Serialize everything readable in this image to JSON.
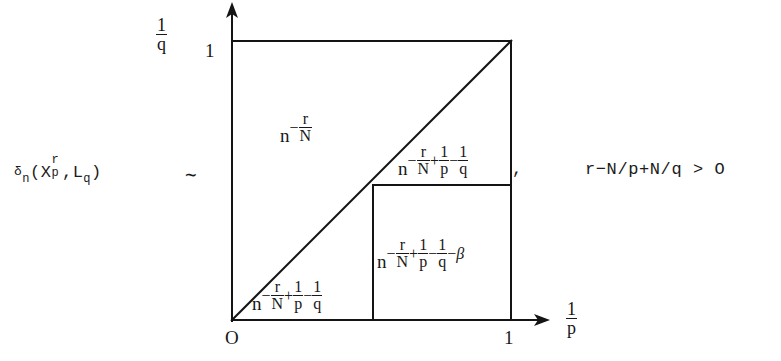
{
  "figure": {
    "lhs": {
      "delta": "δ",
      "delta_sub": "n",
      "open_paren": "(X",
      "x_sup": "r",
      "x_sub": "p",
      "comma_L": ",L",
      "l_sub": "q",
      "close_paren": ")",
      "relation": "∼"
    },
    "separator_comma": ",",
    "condition": "r−N/p+N/q > O",
    "axes": {
      "y_label_num": "1",
      "y_label_den": "q",
      "x_label_num": "1",
      "x_label_den": "p",
      "y_tick_top": "1",
      "origin_tick": "O",
      "x_tick_right": "1"
    },
    "regions": [
      {
        "name": "upper-left",
        "base": "n",
        "exponent_parts": [
          "-",
          "r/N"
        ],
        "text": "n^(-r/N)"
      },
      {
        "name": "middle-right",
        "base": "n",
        "exponent_parts": [
          "-",
          "r/N",
          "+",
          "1/p",
          "-",
          "1/q"
        ],
        "text": "n^(-r/N+1/p-1/q)"
      },
      {
        "name": "lower-right",
        "base": "n",
        "exponent_parts": [
          "-",
          "r/N",
          "+",
          "1/p",
          "-",
          "1/q",
          "-",
          "β"
        ],
        "text": "n^(-r/N+1/p-1/q-β)"
      },
      {
        "name": "bottom-left",
        "base": "n",
        "exponent_parts": [
          "-",
          "r/N",
          "+",
          "1/p",
          "-",
          "1/q"
        ],
        "text": "n^(-r/N+1/p-1/q)"
      }
    ],
    "fractions": {
      "r_over_N_num": "r",
      "r_over_N_den": "N",
      "one_over_p_num": "1",
      "one_over_p_den": "p",
      "one_over_q_num": "1",
      "one_over_q_den": "q",
      "minus": "−",
      "plus": "+",
      "beta": "β"
    },
    "colors": {
      "ink": "#141414",
      "paper": "#ffffff"
    }
  }
}
